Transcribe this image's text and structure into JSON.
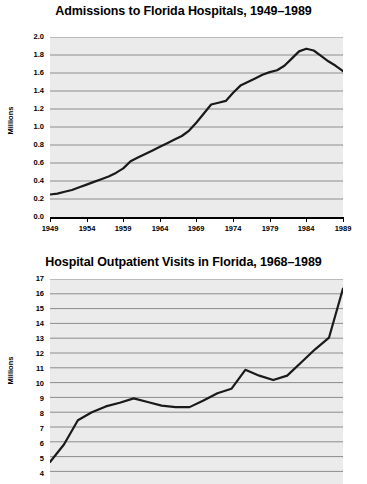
{
  "page": {
    "background_color": "#ffffff",
    "plot_background_color": "#ebebeb",
    "line_color": "#1a1a1a",
    "gridline_color": "#8c8c8c"
  },
  "charts": [
    {
      "id": "admissions",
      "title": "Admissions to Florida Hospitals, 1949–1989",
      "ylabel": "Millions",
      "yticks": [
        "2.0",
        "1.8",
        "1.6",
        "1.4",
        "1.2",
        "1.0",
        "0.8",
        "0.6",
        "0.4",
        "0.2",
        "0.0"
      ],
      "xticks": [
        "1949",
        "1954",
        "1959",
        "1964",
        "1969",
        "1974",
        "1979",
        "1984",
        "1989"
      ]
    },
    {
      "id": "outpatient",
      "title": "Hospital Outpatient Visits in Florida, 1968–1989",
      "ylabel": "Millions",
      "yticks": [
        "17",
        "16",
        "15",
        "14",
        "13",
        "12",
        "11",
        "10",
        "9",
        "8",
        "7",
        "6",
        "5",
        "4",
        "3"
      ],
      "xticks": []
    }
  ],
  "chart_data": [
    {
      "type": "line",
      "title": "Admissions to Florida Hospitals, 1949–1989",
      "xlabel": "",
      "ylabel": "Millions",
      "xlim": [
        1949,
        1989
      ],
      "ylim": [
        0.0,
        2.0
      ],
      "grid": true,
      "legend": "none",
      "x": [
        1949,
        1950,
        1951,
        1952,
        1953,
        1954,
        1955,
        1956,
        1957,
        1958,
        1959,
        1960,
        1961,
        1962,
        1963,
        1964,
        1965,
        1966,
        1967,
        1968,
        1969,
        1970,
        1971,
        1972,
        1973,
        1974,
        1975,
        1976,
        1977,
        1978,
        1979,
        1980,
        1981,
        1982,
        1983,
        1984,
        1985,
        1986,
        1987,
        1988,
        1989
      ],
      "values": [
        0.25,
        0.26,
        0.28,
        0.3,
        0.33,
        0.36,
        0.39,
        0.42,
        0.45,
        0.49,
        0.54,
        0.62,
        0.66,
        0.7,
        0.74,
        0.78,
        0.82,
        0.86,
        0.9,
        0.96,
        1.05,
        1.15,
        1.25,
        1.27,
        1.29,
        1.38,
        1.46,
        1.5,
        1.54,
        1.58,
        1.61,
        1.63,
        1.68,
        1.76,
        1.84,
        1.87,
        1.85,
        1.79,
        1.73,
        1.68,
        1.62
      ]
    },
    {
      "type": "line",
      "title": "Hospital Outpatient Visits in Florida, 1968–1989",
      "xlabel": "",
      "ylabel": "Millions",
      "xlim": [
        1968,
        1989
      ],
      "ylim": [
        3,
        17
      ],
      "grid": true,
      "legend": "none",
      "note": "Bottom of plot is cropped by the screenshot edge; x-axis tick labels are not visible.",
      "x": [
        1968,
        1969,
        1970,
        1971,
        1972,
        1973,
        1974,
        1975,
        1976,
        1977,
        1978,
        1979,
        1980,
        1981,
        1982,
        1983,
        1984,
        1985,
        1986,
        1987,
        1988,
        1989
      ],
      "values": [
        4.5,
        5.7,
        7.35,
        7.9,
        8.3,
        8.55,
        8.85,
        8.6,
        8.35,
        8.25,
        8.25,
        8.7,
        9.2,
        9.5,
        10.8,
        10.4,
        10.1,
        10.4,
        11.3,
        12.2,
        13.0,
        16.35
      ]
    }
  ]
}
